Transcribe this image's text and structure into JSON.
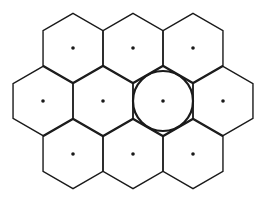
{
  "diagram": {
    "title": "",
    "hex_orientation": "pointy-top",
    "hex_radius": 34.6,
    "colors": {
      "stroke": "#1a1a1a",
      "background": "#ffffff"
    },
    "cells": [
      {
        "id": "cell-r1-c1",
        "cx": 73,
        "cy": 48,
        "highlight": false
      },
      {
        "id": "cell-r1-c2",
        "cx": 133,
        "cy": 48,
        "highlight": false
      },
      {
        "id": "cell-r1-c3",
        "cx": 193,
        "cy": 48,
        "highlight": false
      },
      {
        "id": "cell-r2-c1",
        "cx": 43,
        "cy": 101,
        "highlight": false
      },
      {
        "id": "cell-r2-c2",
        "cx": 103,
        "cy": 101,
        "highlight": false
      },
      {
        "id": "cell-r2-c3",
        "cx": 163,
        "cy": 101,
        "highlight": true
      },
      {
        "id": "cell-r2-c4",
        "cx": 223,
        "cy": 101,
        "highlight": false
      },
      {
        "id": "cell-r3-c1",
        "cx": 73,
        "cy": 154,
        "highlight": false
      },
      {
        "id": "cell-r3-c2",
        "cx": 133,
        "cy": 154,
        "highlight": false
      },
      {
        "id": "cell-r3-c3",
        "cx": 193,
        "cy": 154,
        "highlight": false
      }
    ],
    "inscribed_circle": {
      "cx": 163,
      "cy": 101,
      "r": 30
    },
    "dot_radius": 1.8
  }
}
